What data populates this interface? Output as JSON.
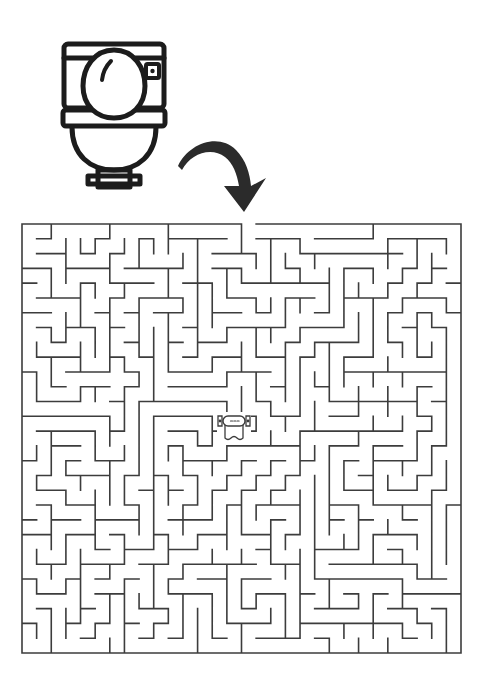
{
  "page": {
    "background_color": "#ffffff",
    "width": 483,
    "height": 681
  },
  "start_icon": {
    "name": "toilet-icon",
    "label": "Toilet",
    "color": "#1c1c1c",
    "x": 58,
    "y": 30,
    "width": 112,
    "height": 156
  },
  "arrow": {
    "name": "curved-arrow-icon",
    "label": "Start here",
    "direction": "down-right",
    "color": "#2b2b2b",
    "x": 176,
    "y": 134,
    "width": 96,
    "height": 80
  },
  "maze": {
    "name": "maze-grid",
    "label": "Maze",
    "wall_color": "#3c3c3c",
    "wall_width": 1.6,
    "x": 22,
    "y": 224,
    "width": 439,
    "height": 429,
    "cols": 30,
    "rows": 29,
    "cell_size": 14.63,
    "entrance": {
      "side": "top",
      "col": 15,
      "label": "Entrance"
    },
    "goal": {
      "name": "toilet-paper-icon",
      "label": "Toilet paper",
      "col": 15,
      "row": 13,
      "center_x": 234,
      "center_y": 421,
      "width": 42,
      "height": 38,
      "color": "#3c3c3c"
    },
    "seed": 20240517
  }
}
